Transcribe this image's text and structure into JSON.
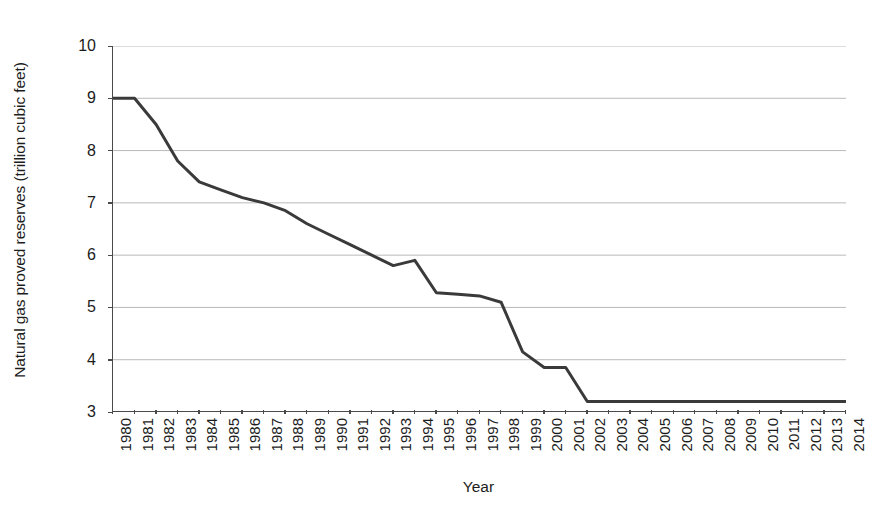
{
  "chart_data": {
    "type": "line",
    "title": "",
    "xlabel": "Year",
    "ylabel": "Natural gas proved reserves (trillion cubic feet)",
    "x": [
      1980,
      1981,
      1982,
      1983,
      1984,
      1985,
      1986,
      1987,
      1988,
      1989,
      1990,
      1991,
      1992,
      1993,
      1994,
      1995,
      1996,
      1997,
      1998,
      1999,
      2000,
      2001,
      2002,
      2003,
      2004,
      2005,
      2006,
      2007,
      2008,
      2009,
      2010,
      2011,
      2012,
      2013,
      2014
    ],
    "values": [
      9.0,
      9.0,
      8.5,
      7.8,
      7.4,
      7.25,
      7.1,
      7.0,
      6.85,
      6.6,
      6.4,
      6.2,
      6.0,
      5.8,
      5.9,
      5.28,
      5.25,
      5.22,
      5.1,
      4.15,
      3.85,
      3.85,
      3.2,
      3.2,
      3.2,
      3.2,
      3.2,
      3.2,
      3.2,
      3.2,
      3.2,
      3.2,
      3.2,
      3.2,
      3.2
    ],
    "series_name": "Natural gas proved reserves",
    "xtick_labels": [
      "1980",
      "1981",
      "1982",
      "1983",
      "1984",
      "1985",
      "1986",
      "1987",
      "1988",
      "1989",
      "1990",
      "1991",
      "1992",
      "1993",
      "1994",
      "1995",
      "1996",
      "1997",
      "1998",
      "1999",
      "2000",
      "2001",
      "2002",
      "2003",
      "2004",
      "2005",
      "2006",
      "2007",
      "2008",
      "2009",
      "2010",
      "2011",
      "2012",
      "2013",
      "2014"
    ],
    "ytick_labels": [
      "10",
      "9",
      "8",
      "7",
      "6",
      "5",
      "4",
      "3"
    ],
    "yticks": [
      10,
      9,
      8,
      7,
      6,
      5,
      4,
      3
    ],
    "ylim": [
      3,
      10
    ],
    "xlim": [
      1980,
      2014
    ],
    "grid": "horizontal",
    "legend": "none",
    "line_color": "#3a3a3a",
    "grid_color": "#b9b9b9",
    "axis_color": "#4a4a4a",
    "background": "#ffffff"
  }
}
